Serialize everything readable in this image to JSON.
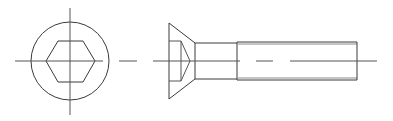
{
  "diagram": {
    "views": [
      {
        "name": "end-view",
        "label": "End view (hex socket)"
      },
      {
        "name": "side-view",
        "label": "Side view"
      }
    ],
    "colors": {
      "background": "#ffffff",
      "outline": "#3a3a3a",
      "centerline": "#555555",
      "thread_minor": "#8a8a8a"
    },
    "geometry": {
      "end_view": {
        "center": [
          70,
          61
        ],
        "outer_circle_radius": 39,
        "hexagon_points": [
          [
            46,
            61
          ],
          [
            58,
            41
          ],
          [
            83,
            41
          ],
          [
            95,
            61
          ],
          [
            83,
            82
          ],
          [
            58,
            82
          ]
        ],
        "vertical_centerline": [
          [
            70,
            8
          ],
          [
            70,
            115
          ]
        ],
        "horizontal_centerline": [
          [
            15,
            61
          ],
          [
            103,
            61
          ]
        ],
        "centerline_dash": [
          [
            119,
            61
          ],
          [
            137,
            61
          ]
        ]
      },
      "side_view": {
        "head_face_x": 169,
        "head_top": [
          169,
          23
        ],
        "head_bottom": [
          169,
          99
        ],
        "shank_start_x": 195,
        "shank_top_y": 43,
        "shank_bottom_y": 79,
        "thread_start_x": 237,
        "end_x": 357,
        "thread_outer_y": [
          42,
          80
        ],
        "thread_inner_y": [
          44,
          78
        ],
        "socket_rect": {
          "x1": 169,
          "x2": 181,
          "y1": 41,
          "y2": 81
        },
        "socket_tip": [
          190,
          61
        ],
        "centerline_segments": [
          [
            [
              153,
              61
            ],
            [
              240,
              61
            ]
          ],
          [
            [
              256,
              61
            ],
            [
              273,
              61
            ]
          ],
          [
            [
              290,
              61
            ],
            [
              377,
              61
            ]
          ]
        ]
      }
    }
  }
}
